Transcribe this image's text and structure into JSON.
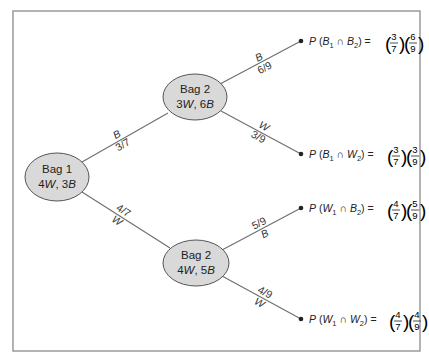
{
  "diagram": {
    "type": "probability-tree",
    "root": {
      "title": "Bag 1",
      "contents": "4W, 3B",
      "contents_parts": {
        "w_count": "4",
        "w": "W",
        "sep": ", ",
        "b_count": "3",
        "b": "B"
      }
    },
    "branches_level1": [
      {
        "outcome": "B",
        "probability": "3/7"
      },
      {
        "outcome": "W",
        "probability": "4/7"
      }
    ],
    "level2_nodes": [
      {
        "title": "Bag 2",
        "contents": "3W, 6B",
        "contents_parts": {
          "w_count": "3",
          "w": "W",
          "sep": ", ",
          "b_count": "6",
          "b": "B"
        },
        "branches": [
          {
            "outcome": "B",
            "probability": "6/9"
          },
          {
            "outcome": "W",
            "probability": "3/9"
          }
        ]
      },
      {
        "title": "Bag 2",
        "contents": "4W, 5B",
        "contents_parts": {
          "w_count": "4",
          "w": "W",
          "sep": ", ",
          "b_count": "5",
          "b": "B"
        },
        "branches": [
          {
            "outcome": "B",
            "probability": "5/9"
          },
          {
            "outcome": "W",
            "probability": "4/9"
          }
        ]
      }
    ],
    "outcomes": [
      {
        "expr": "P(B1 ∩ B2) = (3/7)(6/9)",
        "first": "B",
        "second": "B",
        "f1_num": "3",
        "f1_den": "7",
        "f2_num": "6",
        "f2_den": "9"
      },
      {
        "expr": "P(B1 ∩ W2) = (3/7)(3/9)",
        "first": "B",
        "second": "W",
        "f1_num": "3",
        "f1_den": "7",
        "f2_num": "3",
        "f2_den": "9"
      },
      {
        "expr": "P(W1 ∩ B2) = (4/7)(5/9)",
        "first": "W",
        "second": "B",
        "f1_num": "4",
        "f1_den": "7",
        "f2_num": "5",
        "f2_den": "9"
      },
      {
        "expr": "P(W1 ∩ W2) = (4/7)(4/9)",
        "first": "W",
        "second": "W",
        "f1_num": "4",
        "f1_den": "7",
        "f2_num": "4",
        "f2_den": "9"
      }
    ],
    "symbols": {
      "prob": "P",
      "open": "(",
      "close": ")",
      "cap": " ∩ ",
      "equals": " = ",
      "sub1": "1",
      "sub2": "2"
    },
    "colors": {
      "node_fill": "#d9d9d9",
      "line": "#6e6e6e",
      "frame": "#9a9a9a",
      "text": "#222222"
    }
  }
}
